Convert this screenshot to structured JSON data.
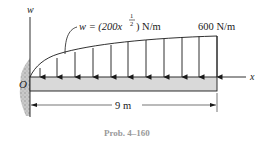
{
  "diagram": {
    "type": "beam-distributed-load",
    "labels": {
      "w_axis": "w",
      "x_axis": "x",
      "origin": "O",
      "load_function_prefix": "w = (200x",
      "load_function_exponent_num": "1",
      "load_function_exponent_den": "2",
      "load_function_suffix": ") N/m",
      "end_load": "600 N/m",
      "span": "9 m",
      "caption": "Prob. 4–160"
    },
    "load": {
      "expression": "w = 200 x^(1/2) N/m",
      "max_value": 600,
      "max_unit": "N/m",
      "arrow_count": 11
    },
    "beam": {
      "length": 9,
      "unit": "m",
      "support": "fixed wall at O"
    },
    "colors": {
      "beam_fill": "#d9d9d9",
      "line": "#1a1a1a",
      "wall": "#b8b8b8",
      "caption": "#9a9a9a"
    }
  }
}
